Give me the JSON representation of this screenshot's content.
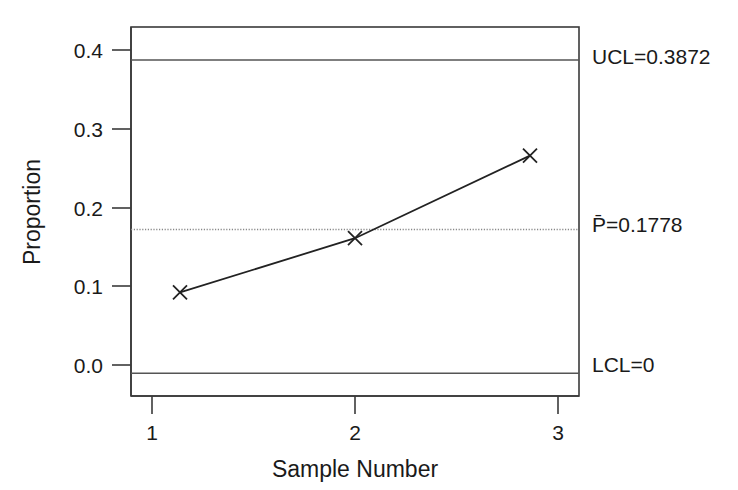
{
  "chart_data": {
    "type": "line",
    "title": "",
    "subtitle": "",
    "xlabel": "Sample Number",
    "ylabel": "Proportion",
    "x": [
      1,
      2,
      3
    ],
    "categories": [
      "1",
      "2",
      "3"
    ],
    "series": [
      {
        "name": "Proportion",
        "values": [
          0.1,
          0.167,
          0.269
        ],
        "marker": "x",
        "line_style": "solid",
        "color": "#222222"
      }
    ],
    "xlim": [
      0.72,
      3.28
    ],
    "ylim": [
      -0.028,
      0.428
    ],
    "xticks": [
      1,
      2,
      3
    ],
    "xtick_labels": [
      "1",
      "2",
      "3"
    ],
    "yticks": [
      0.0,
      0.1,
      0.2,
      0.3,
      0.4
    ],
    "ytick_labels": [
      "0.0",
      "0.1",
      "0.2",
      "0.3",
      "0.4"
    ],
    "grid": false,
    "legend": "none",
    "control_limits": [
      {
        "key": "ucl",
        "label": "UCL=0.3872",
        "value": 0.3872,
        "line_style": "solid",
        "color": "#555555"
      },
      {
        "key": "center",
        "label": "P̄=0.1778",
        "value": 0.1778,
        "line_style": "dotted",
        "color": "#888888"
      },
      {
        "key": "lcl",
        "label": "LCL=0",
        "value": 0.0,
        "line_style": "solid",
        "color": "#555555"
      }
    ]
  },
  "axes": {
    "y_title": "Proportion",
    "x_title": "Sample Number",
    "ytick_0": "0.0",
    "ytick_1": "0.1",
    "ytick_2": "0.2",
    "ytick_3": "0.3",
    "ytick_4": "0.4",
    "xtick_0": "1",
    "xtick_1": "2",
    "xtick_2": "3"
  },
  "limits": {
    "ucl_label": "UCL=0.3872",
    "center_label": "P̄=0.1778",
    "lcl_label": "LCL=0"
  },
  "colors": {
    "background": "#ffffff",
    "frame": "#3a3a3a",
    "series": "#222222",
    "limit_line": "#555555",
    "center_line": "#8c8c8c",
    "text": "#1a1a1a"
  }
}
